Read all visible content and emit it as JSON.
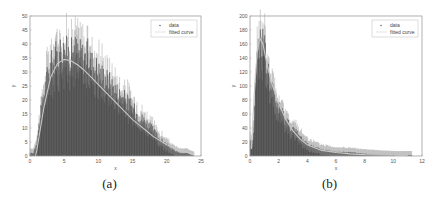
{
  "figure": {
    "captions": [
      "(a)",
      "(b)"
    ]
  },
  "chart_data": [
    {
      "type": "bar",
      "title": "",
      "xlabel": "x",
      "ylabel": "y",
      "xlim": [
        0,
        25
      ],
      "ylim": [
        0,
        50
      ],
      "xticks": [
        0,
        5,
        10,
        15,
        20,
        25
      ],
      "yticks": [
        0,
        5,
        10,
        15,
        20,
        25,
        30,
        35,
        40,
        45,
        50
      ],
      "grid": false,
      "legend": {
        "position": "upper right",
        "entries": [
          "data",
          "fitted curve"
        ]
      },
      "series": [
        {
          "name": "data",
          "kind": "histogram-with-errorbars",
          "x": [
            0.5,
            1,
            1.5,
            2,
            2.5,
            3,
            3.5,
            4,
            4.5,
            5,
            5.5,
            6,
            6.5,
            7,
            7.5,
            8,
            8.5,
            9,
            9.5,
            10,
            11,
            12,
            13,
            14,
            15,
            16,
            17,
            18,
            19,
            20,
            21,
            22,
            23,
            24
          ],
          "values": [
            1,
            5,
            14,
            22,
            28,
            32,
            34,
            36,
            38,
            37,
            37,
            36,
            38,
            37,
            36,
            35,
            36,
            33,
            32,
            30,
            28,
            25,
            22,
            20,
            17,
            14,
            12,
            9,
            6,
            4,
            2,
            1,
            1,
            0
          ],
          "max_errorbar_top": 49
        },
        {
          "name": "fitted curve",
          "kind": "line",
          "x": [
            0.8,
            1,
            2,
            3,
            4,
            5,
            6,
            7,
            8,
            9,
            10,
            11,
            12,
            13,
            14,
            15,
            16,
            17,
            18,
            19,
            20,
            21,
            22,
            23,
            24
          ],
          "values": [
            0,
            2,
            17,
            28,
            33,
            34.5,
            34,
            32.5,
            30.5,
            28,
            25.5,
            23,
            20.5,
            18,
            15.5,
            13,
            11,
            9,
            7,
            5.5,
            4,
            3,
            2,
            1.3,
            0.8
          ]
        }
      ],
      "caption": "(a)"
    },
    {
      "type": "bar",
      "title": "",
      "xlabel": "x",
      "ylabel": "y",
      "xlim": [
        0,
        12
      ],
      "ylim": [
        0,
        200
      ],
      "xticks": [
        0,
        2,
        4,
        6,
        8,
        10,
        12
      ],
      "yticks": [
        0,
        20,
        40,
        60,
        80,
        100,
        120,
        140,
        160,
        180,
        200
      ],
      "grid": false,
      "legend": {
        "position": "upper right",
        "entries": [
          "data",
          "fitted curve"
        ]
      },
      "series": [
        {
          "name": "data",
          "kind": "histogram-with-errorbars",
          "x": [
            0.2,
            0.4,
            0.6,
            0.8,
            1.0,
            1.2,
            1.4,
            1.6,
            1.8,
            2.0,
            2.5,
            3.0,
            3.5,
            4.0,
            4.5,
            5.0,
            6.0,
            7.0,
            8.0,
            9.0,
            10.0,
            11.0
          ],
          "values": [
            20,
            110,
            160,
            170,
            150,
            125,
            105,
            90,
            78,
            68,
            52,
            38,
            27,
            18,
            12,
            9,
            6,
            5,
            3,
            2,
            1,
            1
          ],
          "max_errorbar_top": 193
        },
        {
          "name": "fitted curve",
          "kind": "line",
          "x": [
            0.1,
            0.3,
            0.5,
            0.7,
            0.9,
            1.2,
            1.5,
            2.0,
            2.5,
            3.0,
            3.5,
            4.0,
            5.0,
            6.0,
            7.0,
            8.0,
            9.0,
            10.0,
            11.0
          ],
          "values": [
            10,
            90,
            150,
            168,
            160,
            130,
            105,
            75,
            52,
            36,
            24,
            16,
            8,
            5,
            3,
            2,
            1.5,
            1,
            0.6
          ]
        }
      ],
      "caption": "(b)"
    }
  ]
}
